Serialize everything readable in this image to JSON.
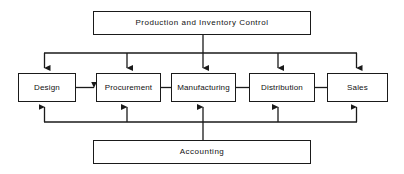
{
  "diagram": {
    "title_node": {
      "label": "Production and Inventory Control",
      "name": "production-and-inventory-control-box"
    },
    "footer_node": {
      "label": "Accounting",
      "name": "accounting-box"
    },
    "process_nodes": [
      {
        "label": "Design",
        "name": "design-box"
      },
      {
        "label": "Procurement",
        "name": "procurement-box"
      },
      {
        "label": "Manufacturing",
        "name": "manufacturing-box"
      },
      {
        "label": "Distribution",
        "name": "distribution-box"
      },
      {
        "label": "Sales",
        "name": "sales-box"
      }
    ],
    "colors": {
      "stroke": "#1a1a1a",
      "fill": "#ffffff",
      "text": "#111111"
    },
    "connectors": {
      "top_bus_label": "top-distribution-bus",
      "bottom_bus_label": "bottom-collection-bus",
      "chain_label": "process-chain-arrow"
    }
  }
}
